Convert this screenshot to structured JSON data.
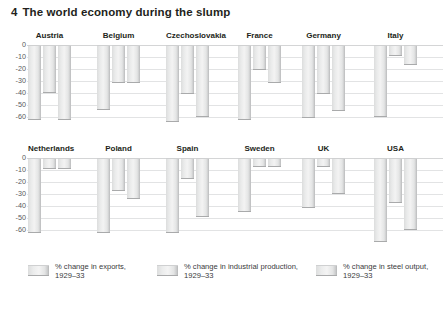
{
  "title": {
    "number": "4",
    "text": "The world economy during the slump"
  },
  "axis": {
    "ticks": [
      "0",
      "-10",
      "-20",
      "-30",
      "-40",
      "-50",
      "-60"
    ],
    "min": -65,
    "max": 0
  },
  "legend": {
    "items": [
      {
        "name": "exports",
        "line1": "% change in exports,",
        "line2": "1929–33",
        "swatch_color": "#e8e9e9"
      },
      {
        "name": "industrial",
        "line1": "% change in industrial production,",
        "line2": "1929–33",
        "swatch_color": "#e8e9e9"
      },
      {
        "name": "steel",
        "line1": "% change in steel output,",
        "line2": "1929–33",
        "swatch_color": "#e8e9e9"
      }
    ]
  },
  "chart_data": {
    "type": "bar",
    "title": "The world economy during the slump",
    "xlabel": "",
    "ylabel": "",
    "ylim": [
      -65,
      0
    ],
    "grid": true,
    "legend_position": "bottom",
    "categories": [
      "Austria",
      "Belgium",
      "Czechoslovakia",
      "France",
      "Germany",
      "Italy",
      "Netherlands",
      "Poland",
      "Spain",
      "Sweden",
      "UK",
      "USA"
    ],
    "series": [
      {
        "name": "% change in exports, 1929–33",
        "values": [
          -62,
          -53,
          -63,
          -62,
          -60,
          -59,
          -62,
          -62,
          -62,
          -44,
          -41,
          -69
        ]
      },
      {
        "name": "% change in industrial production, 1929–33",
        "values": [
          -39,
          -31,
          -40,
          -20,
          -40,
          -8,
          -8,
          -27,
          -17,
          -7,
          -7,
          -37
        ]
      },
      {
        "name": "% change in steel output, 1929–33",
        "values": [
          -62,
          -31,
          -59,
          -31,
          -54,
          -16,
          -8,
          -33,
          -48,
          -7,
          -29,
          -59
        ]
      }
    ],
    "rows": [
      {
        "row": 1,
        "categories": [
          "Austria",
          "Belgium",
          "Czechoslovakia",
          "France",
          "Germany",
          "Italy"
        ]
      },
      {
        "row": 2,
        "categories": [
          "Netherlands",
          "Poland",
          "Spain",
          "Sweden",
          "UK",
          "USA"
        ]
      }
    ]
  }
}
